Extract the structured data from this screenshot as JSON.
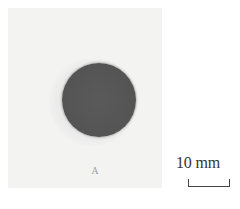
{
  "figure": {
    "panel_label": "A",
    "scale_bar": {
      "label": "10 mm"
    },
    "subject": {
      "shape": "circle",
      "description": "dark gray circular disk on light background",
      "fill_color": "#555555",
      "background_color": "#f3f3f2"
    }
  }
}
